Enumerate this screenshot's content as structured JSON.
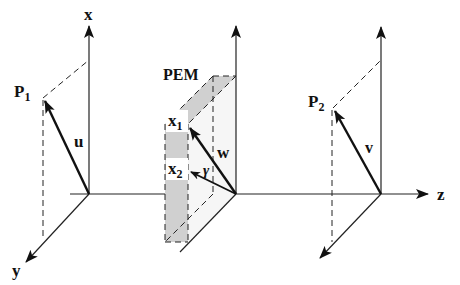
{
  "diagram": {
    "type": "3d-vector-projection",
    "colors": {
      "line": "#222222",
      "plane_fill": "#f4f4f4",
      "strip_fill": "#cfcfcf"
    },
    "axes": {
      "x_label": "x",
      "y_label": "y",
      "z_label": "z"
    },
    "points": {
      "p1": {
        "label": "P",
        "subscript": "1"
      },
      "p2": {
        "label": "P",
        "subscript": "2"
      }
    },
    "vectors": {
      "u": "u",
      "v": "v",
      "w": "w"
    },
    "plane": {
      "label": "PEM",
      "x1": {
        "label": "x",
        "subscript": "1"
      },
      "x2": {
        "label": "x",
        "subscript": "2"
      },
      "angle": "γ"
    }
  }
}
